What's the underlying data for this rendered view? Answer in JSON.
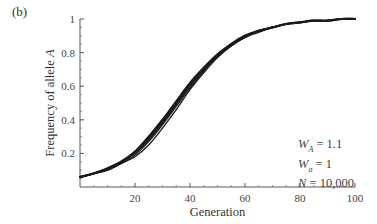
{
  "panel_label": "(b)",
  "annotations": [
    {
      "symbol": "W",
      "subscript": "A",
      "text": " = 1.1"
    },
    {
      "symbol": "W",
      "subscript": "a",
      "text": " = 1"
    },
    {
      "symbol": "N",
      "subscript": "",
      "text": " = 10,000"
    }
  ],
  "chart_data": {
    "type": "line",
    "title": "",
    "xlabel": "Generation",
    "ylabel": "Frequency of allele A",
    "xlim": [
      0,
      100
    ],
    "ylim": [
      0,
      1
    ],
    "x_ticks": [
      20,
      40,
      60,
      80,
      100
    ],
    "y_ticks": [
      0.2,
      0.4,
      0.6,
      0.8,
      1
    ],
    "x_tick_labels": [
      "20",
      "40",
      "60",
      "80",
      "100"
    ],
    "y_tick_labels": [
      "0.2",
      "0.4",
      "0.6",
      "0.8",
      "1"
    ],
    "grid": false,
    "legend": null,
    "x": [
      0,
      5,
      10,
      15,
      20,
      25,
      30,
      35,
      40,
      45,
      50,
      55,
      60,
      65,
      70,
      75,
      80,
      85,
      90,
      95,
      100
    ],
    "series": [
      {
        "name": "replicate 1",
        "values": [
          0.06,
          0.08,
          0.11,
          0.15,
          0.21,
          0.3,
          0.4,
          0.51,
          0.62,
          0.71,
          0.79,
          0.85,
          0.9,
          0.93,
          0.95,
          0.97,
          0.98,
          0.99,
          0.99,
          1.0,
          1.0
        ]
      },
      {
        "name": "replicate 2",
        "values": [
          0.06,
          0.08,
          0.11,
          0.15,
          0.21,
          0.29,
          0.39,
          0.5,
          0.61,
          0.7,
          0.78,
          0.85,
          0.9,
          0.93,
          0.95,
          0.97,
          0.98,
          0.99,
          0.99,
          1.0,
          1.0
        ]
      },
      {
        "name": "replicate 3",
        "values": [
          0.06,
          0.08,
          0.1,
          0.14,
          0.19,
          0.27,
          0.37,
          0.48,
          0.59,
          0.69,
          0.78,
          0.84,
          0.89,
          0.93,
          0.95,
          0.97,
          0.98,
          0.99,
          0.99,
          1.0,
          1.0
        ]
      },
      {
        "name": "replicate 4",
        "values": [
          0.06,
          0.08,
          0.1,
          0.14,
          0.18,
          0.25,
          0.35,
          0.46,
          0.58,
          0.68,
          0.77,
          0.84,
          0.89,
          0.92,
          0.95,
          0.97,
          0.98,
          0.99,
          0.99,
          1.0,
          1.0
        ]
      },
      {
        "name": "replicate 5",
        "values": [
          0.06,
          0.08,
          0.11,
          0.15,
          0.2,
          0.28,
          0.38,
          0.49,
          0.6,
          0.7,
          0.78,
          0.85,
          0.89,
          0.93,
          0.95,
          0.97,
          0.98,
          0.99,
          0.99,
          1.0,
          1.0
        ]
      }
    ],
    "annotation": "W_A = 1.1, W_a = 1, N = 10,000"
  }
}
